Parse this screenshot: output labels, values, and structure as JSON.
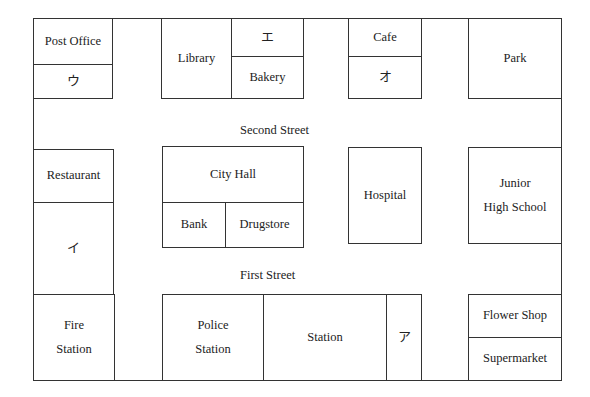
{
  "map": {
    "streets": {
      "second": "Second Street",
      "first": "First Street"
    },
    "buildings": {
      "post_office": "Post Office",
      "u": "ウ",
      "library": "Library",
      "e": "エ",
      "bakery": "Bakery",
      "cafe": "Cafe",
      "o": "オ",
      "park": "Park",
      "restaurant": "Restaurant",
      "i": "イ",
      "city_hall": "City Hall",
      "bank": "Bank",
      "drugstore": "Drugstore",
      "hospital": "Hospital",
      "junior_high_line1": "Junior",
      "junior_high_line2": "High School",
      "fire_station_line1": "Fire",
      "fire_station_line2": "Station",
      "police_station_line1": "Police",
      "police_station_line2": "Station",
      "station": "Station",
      "a": "ア",
      "flower_shop": "Flower Shop",
      "supermarket": "Supermarket"
    }
  }
}
